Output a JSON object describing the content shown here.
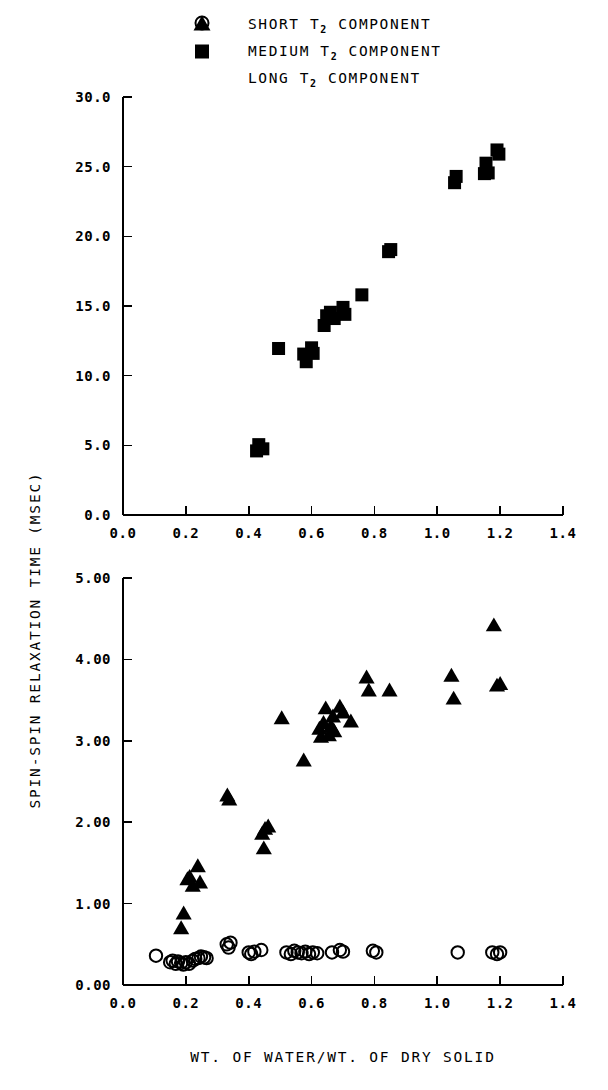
{
  "figure": {
    "ylabel": "SPIN-SPIN RELAXATION TIME (MSEC)",
    "xlabel": "WT. OF WATER/WT. OF DRY SOLID"
  },
  "legend": {
    "position": "top-center",
    "items": [
      {
        "marker": "circle-open-marker",
        "prefix": "SHORT ",
        "sub": "2",
        "suffix": " COMPONENT",
        "label": "SHORT T2 COMPONENT"
      },
      {
        "marker": "triangle-filled-marker",
        "prefix": "MEDIUM ",
        "sub": "2",
        "suffix": " COMPONENT",
        "label": "MEDIUM T2 COMPONENT"
      },
      {
        "marker": "square-filled-marker",
        "prefix": "LONG ",
        "sub": "2",
        "suffix": " COMPONENT",
        "label": "LONG T2 COMPONENT"
      }
    ]
  },
  "chart_data": [
    {
      "type": "scatter",
      "panel": "top",
      "title": "",
      "xlabel": "",
      "ylabel": "SPIN-SPIN RELAXATION TIME (MSEC)",
      "xlim": [
        0.0,
        1.4
      ],
      "ylim": [
        0.0,
        30.0
      ],
      "xticks": [
        0.0,
        0.2,
        0.4,
        0.6,
        0.8,
        1.0,
        1.2,
        1.4
      ],
      "xticklabels": [
        "0.0",
        "0.2",
        "0.4",
        "0.6",
        "0.8",
        "1.0",
        "1.2",
        "1.4"
      ],
      "yticks": [
        0.0,
        5.0,
        10.0,
        15.0,
        20.0,
        25.0,
        30.0
      ],
      "yticklabels": [
        "0.0",
        "5.0",
        "10.0",
        "15.0",
        "20.0",
        "25.0",
        "30.0"
      ],
      "grid": false,
      "series": [
        {
          "name": "LONG T2 COMPONENT",
          "marker": "square-filled-marker",
          "color": "#000000",
          "points": [
            [
              0.425,
              4.6
            ],
            [
              0.432,
              5.05
            ],
            [
              0.445,
              4.75
            ],
            [
              0.495,
              11.95
            ],
            [
              0.575,
              11.55
            ],
            [
              0.583,
              11.0
            ],
            [
              0.6,
              12.0
            ],
            [
              0.605,
              11.6
            ],
            [
              0.64,
              13.6
            ],
            [
              0.648,
              14.3
            ],
            [
              0.66,
              14.55
            ],
            [
              0.672,
              14.1
            ],
            [
              0.7,
              14.9
            ],
            [
              0.706,
              14.4
            ],
            [
              0.76,
              15.8
            ],
            [
              0.845,
              18.9
            ],
            [
              0.852,
              19.05
            ],
            [
              1.055,
              23.85
            ],
            [
              1.06,
              24.3
            ],
            [
              1.15,
              24.5
            ],
            [
              1.155,
              25.25
            ],
            [
              1.162,
              24.55
            ],
            [
              1.19,
              26.2
            ],
            [
              1.196,
              25.9
            ]
          ]
        }
      ]
    },
    {
      "type": "scatter",
      "panel": "bottom",
      "title": "",
      "xlabel": "WT. OF WATER/WT. OF DRY SOLID",
      "ylabel": "SPIN-SPIN RELAXATION TIME (MSEC)",
      "xlim": [
        0.0,
        1.4
      ],
      "ylim": [
        0.0,
        5.0
      ],
      "xticks": [
        0.0,
        0.2,
        0.4,
        0.6,
        0.8,
        1.0,
        1.2,
        1.4
      ],
      "xticklabels": [
        "0.0",
        "0.2",
        "0.4",
        "0.6",
        "0.8",
        "1.0",
        "1.2",
        "1.4"
      ],
      "yticks": [
        0.0,
        1.0,
        2.0,
        3.0,
        4.0,
        5.0
      ],
      "yticklabels": [
        "0.00",
        "1.00",
        "2.00",
        "3.00",
        "4.00",
        "5.00"
      ],
      "grid": false,
      "series": [
        {
          "name": "MEDIUM T2 COMPONENT",
          "marker": "triangle-filled-marker",
          "color": "#000000",
          "points": [
            [
              0.185,
              0.7
            ],
            [
              0.193,
              0.88
            ],
            [
              0.205,
              1.3
            ],
            [
              0.212,
              1.33
            ],
            [
              0.222,
              1.22
            ],
            [
              0.238,
              1.46
            ],
            [
              0.245,
              1.26
            ],
            [
              0.332,
              2.33
            ],
            [
              0.338,
              2.28
            ],
            [
              0.443,
              1.86
            ],
            [
              0.448,
              1.68
            ],
            [
              0.452,
              1.92
            ],
            [
              0.462,
              1.95
            ],
            [
              0.505,
              3.28
            ],
            [
              0.575,
              2.76
            ],
            [
              0.625,
              3.15
            ],
            [
              0.63,
              3.05
            ],
            [
              0.638,
              3.22
            ],
            [
              0.645,
              3.4
            ],
            [
              0.655,
              3.07
            ],
            [
              0.662,
              3.18
            ],
            [
              0.668,
              3.3
            ],
            [
              0.672,
              3.12
            ],
            [
              0.69,
              3.42
            ],
            [
              0.7,
              3.35
            ],
            [
              0.725,
              3.24
            ],
            [
              0.775,
              3.78
            ],
            [
              0.782,
              3.62
            ],
            [
              0.848,
              3.62
            ],
            [
              1.045,
              3.8
            ],
            [
              1.052,
              3.52
            ],
            [
              1.18,
              4.42
            ],
            [
              1.19,
              3.68
            ],
            [
              1.2,
              3.7
            ]
          ]
        },
        {
          "name": "SHORT T2 COMPONENT",
          "marker": "circle-open-marker",
          "color": "#000000",
          "points": [
            [
              0.105,
              0.36
            ],
            [
              0.15,
              0.28
            ],
            [
              0.158,
              0.3
            ],
            [
              0.168,
              0.26
            ],
            [
              0.175,
              0.29
            ],
            [
              0.185,
              0.27
            ],
            [
              0.192,
              0.25
            ],
            [
              0.2,
              0.28
            ],
            [
              0.21,
              0.26
            ],
            [
              0.222,
              0.3
            ],
            [
              0.23,
              0.32
            ],
            [
              0.24,
              0.33
            ],
            [
              0.248,
              0.35
            ],
            [
              0.258,
              0.34
            ],
            [
              0.266,
              0.33
            ],
            [
              0.33,
              0.5
            ],
            [
              0.336,
              0.46
            ],
            [
              0.342,
              0.52
            ],
            [
              0.4,
              0.4
            ],
            [
              0.408,
              0.38
            ],
            [
              0.418,
              0.41
            ],
            [
              0.44,
              0.43
            ],
            [
              0.52,
              0.4
            ],
            [
              0.534,
              0.38
            ],
            [
              0.545,
              0.42
            ],
            [
              0.556,
              0.4
            ],
            [
              0.568,
              0.39
            ],
            [
              0.58,
              0.41
            ],
            [
              0.592,
              0.38
            ],
            [
              0.604,
              0.4
            ],
            [
              0.618,
              0.39
            ],
            [
              0.665,
              0.4
            ],
            [
              0.69,
              0.43
            ],
            [
              0.7,
              0.41
            ],
            [
              0.795,
              0.42
            ],
            [
              0.806,
              0.4
            ],
            [
              1.065,
              0.4
            ],
            [
              1.175,
              0.4
            ],
            [
              1.19,
              0.38
            ],
            [
              1.2,
              0.4
            ]
          ]
        }
      ]
    }
  ]
}
